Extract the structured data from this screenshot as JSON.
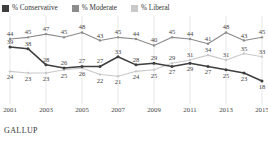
{
  "legend": {
    "items": [
      {
        "label": "% Conservative",
        "color": "#3f3f3f",
        "key": "conservative"
      },
      {
        "label": "% Moderate",
        "color": "#8c8c8c",
        "key": "moderate"
      },
      {
        "label": "% Liberal",
        "color": "#c9c9c9",
        "key": "liberal"
      }
    ]
  },
  "source": {
    "label": "GALLUP"
  },
  "chart_data": {
    "type": "line",
    "title": "",
    "subtitle": "",
    "xlabel": "",
    "ylabel": "",
    "grid": "vertical-only",
    "legend_position": "top-left",
    "ylim": [
      10,
      52
    ],
    "xlim": [
      2001,
      2015
    ],
    "x": [
      2001,
      2002,
      2003,
      2004,
      2005,
      2006,
      2007,
      2008,
      2009,
      2010,
      2011,
      2012,
      2013,
      2014,
      2015
    ],
    "tick_labels": [
      "2001",
      "2003",
      "2005",
      "2007",
      "2009",
      "2011",
      "2013",
      "2015"
    ],
    "tick_values": [
      2001,
      2003,
      2005,
      2007,
      2009,
      2011,
      2013,
      2015
    ],
    "series": [
      {
        "name": "% Moderate",
        "color": "#8c8c8c",
        "values": [
          44,
          45,
          47,
          45,
          48,
          43,
          45,
          44,
          40,
          45,
          44,
          41,
          48,
          43,
          45
        ]
      },
      {
        "name": "% Conservative",
        "color": "#3f3f3f",
        "values": [
          39,
          38,
          28,
          26,
          27,
          27,
          33,
          28,
          29,
          27,
          29,
          27,
          25,
          23,
          18
        ]
      },
      {
        "name": "% Liberal",
        "color": "#c9c9c9",
        "values": [
          24,
          23,
          23,
          25,
          26,
          22,
          21,
          24,
          25,
          29,
          31,
          34,
          31,
          35,
          33
        ]
      }
    ],
    "point_labels": {
      "moderate": [
        "44",
        "45",
        "47",
        "45",
        "48",
        "43",
        "45",
        "44",
        "40",
        "45",
        "44",
        "41",
        "48",
        "43",
        "45"
      ],
      "conservative": [
        "39",
        "38",
        "28",
        "26",
        "27",
        "27",
        "33",
        "28",
        "29",
        "27",
        "29",
        "27",
        "25",
        "23",
        "18"
      ],
      "liberal": [
        "24",
        "23",
        "23",
        "25",
        "26",
        "22",
        "21",
        "24",
        "25",
        "29",
        "31",
        "34",
        "31",
        "35",
        "33"
      ]
    }
  }
}
